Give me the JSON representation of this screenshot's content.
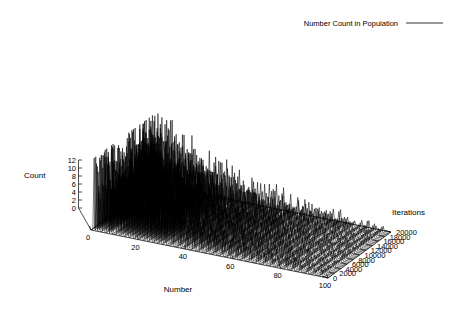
{
  "legend": {
    "entries": [
      {
        "label": "Number Count in Population",
        "sample": "line",
        "color": "#000000"
      }
    ]
  },
  "axes": {
    "x": {
      "title": "Number",
      "min": 0,
      "max": 100,
      "ticks": [
        0,
        20,
        40,
        60,
        80,
        100
      ],
      "tick_labels": [
        "0",
        "20",
        "40",
        "60",
        "80",
        "100"
      ]
    },
    "y": {
      "title": "Iterations",
      "min": 0,
      "max": 20000,
      "ticks": [
        0,
        2000,
        4000,
        6000,
        8000,
        10000,
        12000,
        14000,
        16000,
        18000,
        20000
      ],
      "tick_labels": [
        "0",
        "2000",
        "4000",
        "6000",
        "8000",
        "10000",
        "12000",
        "14000",
        "16000",
        "18000",
        "20000"
      ]
    },
    "z": {
      "title": "Count",
      "min": 0,
      "max": 12,
      "ticks": [
        0,
        2,
        4,
        6,
        8,
        10,
        12
      ],
      "tick_labels": [
        "0",
        "2",
        "4",
        "6",
        "8",
        "10",
        "12"
      ]
    }
  },
  "chart_data": {
    "type": "line",
    "render": "surface3d",
    "title": "",
    "xlabel": "Number",
    "ylabel": "Iterations",
    "zlabel": "Count",
    "xlim": [
      0,
      100
    ],
    "ylim": [
      0,
      20000
    ],
    "zlim": [
      0,
      12
    ],
    "grid": true,
    "legend": "Number Count in Population",
    "legend_position": "top-right",
    "series_name": "Number Count in Population",
    "color": "#000000",
    "n_iteration_slices": 40,
    "peak_count": 12,
    "x": [
      0,
      2,
      4,
      6,
      8,
      10,
      12,
      14,
      16,
      18,
      20,
      22,
      24,
      26,
      28,
      30,
      32,
      34,
      36,
      38,
      40,
      42,
      44,
      46,
      48,
      50,
      52,
      54,
      56,
      58,
      60,
      62,
      64,
      66,
      68,
      70,
      72,
      74,
      76,
      78,
      80,
      82,
      84,
      86,
      88,
      90,
      92,
      94,
      96,
      98,
      100
    ],
    "spike_numbers": [
      1,
      2,
      3,
      5,
      7,
      8,
      11,
      13,
      15,
      17,
      19,
      21,
      23,
      25,
      27,
      29,
      31,
      34,
      37,
      40,
      43,
      46,
      49,
      52,
      55,
      58,
      61,
      64,
      67,
      70,
      73,
      76,
      79,
      82,
      85,
      88,
      91,
      94,
      97
    ],
    "spike_peaks": [
      12,
      11.6,
      11.2,
      10.8,
      10.3,
      9.9,
      9.4,
      9.0,
      8.6,
      8.2,
      7.8,
      7.4,
      7.0,
      6.7,
      6.3,
      6.0,
      5.6,
      5.3,
      5.0,
      4.7,
      4.4,
      4.1,
      3.9,
      3.6,
      3.4,
      3.1,
      2.9,
      2.7,
      2.5,
      2.3,
      2.1,
      2.0,
      1.8,
      1.6,
      1.5,
      1.3,
      1.2,
      1.1,
      1.0
    ]
  },
  "view": {
    "projection": "isometric",
    "rot_x": 60,
    "rot_z": 30
  }
}
